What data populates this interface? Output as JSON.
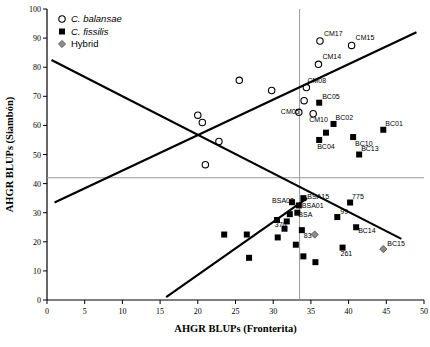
{
  "chart_data": {
    "type": "scatter",
    "title": "",
    "xlabel": "AHGR BLUPs (Fronterita)",
    "ylabel": "AHGR BLUPs (Siambón)",
    "xlim": [
      0,
      50
    ],
    "ylim": [
      0,
      100
    ],
    "xticks": [
      0,
      5,
      10,
      15,
      20,
      25,
      30,
      35,
      40,
      45,
      50
    ],
    "yticks": [
      0,
      10,
      20,
      30,
      40,
      50,
      60,
      70,
      80,
      90,
      100
    ],
    "grid": false,
    "legend_position": "top-left",
    "legend": [
      {
        "key": "balansae",
        "label": "C. balansae",
        "marker": "open-circle",
        "italic": true
      },
      {
        "key": "fissilis",
        "label": "C. fissilis",
        "marker": "filled-square",
        "italic": true
      },
      {
        "key": "hybrid",
        "label": "Hybrid",
        "marker": "gray-diamond",
        "italic": false
      }
    ],
    "reference_lines": [
      {
        "name": "horizontal-mean-line",
        "orientation": "horizontal",
        "value": 42,
        "color": "#9a9a9a"
      },
      {
        "name": "vertical-mean-line",
        "orientation": "vertical",
        "value": 33.5,
        "color": "#9a9a9a"
      }
    ],
    "trend_lines": [
      {
        "name": "descending-regression-line",
        "x1": 0.6,
        "y1": 82.5,
        "x2": 47.0,
        "y2": 21.0,
        "color": "#000000"
      },
      {
        "name": "ascending-regression-line-upper",
        "x1": 1.0,
        "y1": 33.5,
        "x2": 49.0,
        "y2": 92.0,
        "color": "#000000"
      },
      {
        "name": "ascending-regression-line-lower",
        "x1": 15.8,
        "y1": 1.0,
        "x2": 34.5,
        "y2": 35.0,
        "color": "#000000"
      }
    ],
    "series": [
      {
        "name": "C. balansae",
        "marker": "open-circle",
        "points": [
          {
            "x": 20.0,
            "y": 63.5,
            "label": ""
          },
          {
            "x": 20.6,
            "y": 61.0,
            "label": ""
          },
          {
            "x": 22.8,
            "y": 54.5,
            "label": ""
          },
          {
            "x": 21.0,
            "y": 46.5,
            "label": ""
          },
          {
            "x": 25.5,
            "y": 75.5,
            "label": ""
          },
          {
            "x": 29.8,
            "y": 72.0,
            "label": ""
          },
          {
            "x": 36.2,
            "y": 89.0,
            "label": "CM17",
            "lx": 4,
            "ly": -5
          },
          {
            "x": 40.4,
            "y": 87.5,
            "label": "CM15",
            "lx": 4,
            "ly": -5
          },
          {
            "x": 36.0,
            "y": 81.0,
            "label": "CM14",
            "lx": 4,
            "ly": -5
          },
          {
            "x": 34.4,
            "y": 73.0,
            "label": "CM08",
            "lx": 1,
            "ly": -5
          },
          {
            "x": 34.1,
            "y": 68.5,
            "label": "",
            "lx": 0,
            "ly": 0
          },
          {
            "x": 33.4,
            "y": 64.5,
            "label": "CM05",
            "lx": -18,
            "ly": 2
          },
          {
            "x": 35.3,
            "y": 64.0,
            "label": "CM10",
            "lx": -4,
            "ly": 8
          }
        ]
      },
      {
        "name": "C. fissilis",
        "marker": "filled-square",
        "points": [
          {
            "x": 36.1,
            "y": 67.8,
            "label": "BC05",
            "lx": 3,
            "ly": -4
          },
          {
            "x": 38.0,
            "y": 60.5,
            "label": "BC02",
            "lx": 2,
            "ly": -4
          },
          {
            "x": 37.0,
            "y": 57.5,
            "label": "",
            "lx": 0,
            "ly": 0
          },
          {
            "x": 36.1,
            "y": 55.0,
            "label": "BC04",
            "lx": -2,
            "ly": 9
          },
          {
            "x": 40.6,
            "y": 56.0,
            "label": "BC10",
            "lx": 2,
            "ly": 9
          },
          {
            "x": 44.6,
            "y": 58.5,
            "label": "BC01",
            "lx": 2,
            "ly": -4
          },
          {
            "x": 41.4,
            "y": 50.0,
            "label": "BC13",
            "lx": 2,
            "ly": -4
          },
          {
            "x": 34.0,
            "y": 35.0,
            "label": "BSA15",
            "lx": 4,
            "ly": 1
          },
          {
            "x": 33.4,
            "y": 32.5,
            "label": "BSA01",
            "lx": 3,
            "ly": 3
          },
          {
            "x": 32.5,
            "y": 33.6,
            "label": "BSA02",
            "lx": -20,
            "ly": 1
          },
          {
            "x": 33.2,
            "y": 30.0,
            "label": "BSA",
            "lx": 1,
            "ly": 4
          },
          {
            "x": 40.2,
            "y": 33.5,
            "label": "775",
            "lx": 2,
            "ly": -4
          },
          {
            "x": 38.5,
            "y": 28.5,
            "label": "99",
            "lx": 3,
            "ly": -3
          },
          {
            "x": 41.0,
            "y": 25.0,
            "label": "BC14",
            "lx": 2,
            "ly": 6
          },
          {
            "x": 39.2,
            "y": 18.0,
            "label": "261",
            "lx": -2,
            "ly": 8
          },
          {
            "x": 31.8,
            "y": 27.0,
            "label": "370",
            "lx": -12,
            "ly": 6
          },
          {
            "x": 33.8,
            "y": 24.0,
            "label": "83",
            "lx": 2,
            "ly": 8
          },
          {
            "x": 30.5,
            "y": 27.5,
            "label": "",
            "lx": 0,
            "ly": 0
          },
          {
            "x": 31.5,
            "y": 24.5,
            "label": "",
            "lx": 0,
            "ly": 0
          },
          {
            "x": 30.6,
            "y": 21.5,
            "label": "",
            "lx": 0,
            "ly": 0
          },
          {
            "x": 32.2,
            "y": 29.5,
            "label": "",
            "lx": 0,
            "ly": 0
          },
          {
            "x": 33.0,
            "y": 19.0,
            "label": "",
            "lx": 0,
            "ly": 0
          },
          {
            "x": 34.0,
            "y": 15.0,
            "label": "",
            "lx": 0,
            "ly": 0
          },
          {
            "x": 26.5,
            "y": 22.5,
            "label": "",
            "lx": 0,
            "ly": 0
          },
          {
            "x": 23.5,
            "y": 22.5,
            "label": "",
            "lx": 0,
            "ly": 0
          },
          {
            "x": 26.8,
            "y": 14.5,
            "label": "",
            "lx": 0,
            "ly": 0
          },
          {
            "x": 35.6,
            "y": 13.0,
            "label": "",
            "lx": 0,
            "ly": 0
          }
        ]
      },
      {
        "name": "Hybrid",
        "marker": "gray-diamond",
        "points": [
          {
            "x": 35.5,
            "y": 22.5,
            "label": "",
            "lx": 0,
            "ly": 0
          },
          {
            "x": 44.6,
            "y": 17.5,
            "label": "BC15",
            "lx": 4,
            "ly": -3
          }
        ]
      }
    ]
  }
}
